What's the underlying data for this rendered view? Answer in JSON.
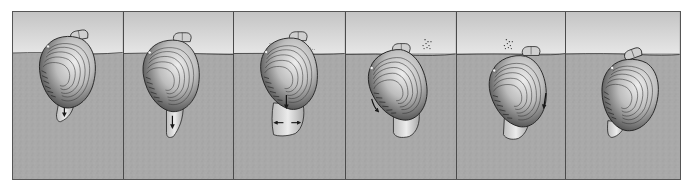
{
  "figure": {
    "panel_count": 6,
    "colors": {
      "water_top": "#c6c6c6",
      "water_bottom": "#e4e4e4",
      "sediment": "#a9a9a9",
      "sediment_speckle": "#9a9a9a",
      "outline": "#2a2a2a",
      "shell_light": "#e6e6e6",
      "shell_dark": "#4a4a4a",
      "foot": "#d8d8d8",
      "divider": "#4a4a4a"
    },
    "water_line_y": 41,
    "panels": [
      {
        "index": 1,
        "stage": "foot-probing",
        "arrows": [
          "down-in-foot"
        ],
        "particles": false,
        "width": 111
      },
      {
        "index": 2,
        "stage": "foot-extended",
        "arrows": [
          "down-in-foot"
        ],
        "particles": false,
        "width": 111
      },
      {
        "index": 3,
        "stage": "foot-anchoring",
        "arrows": [
          "down-at-shell",
          "left-in-foot",
          "right-in-foot"
        ],
        "particles": true,
        "width": 112
      },
      {
        "index": 4,
        "stage": "shell-rocking",
        "arrows": [
          "down-left-at-shell"
        ],
        "particles": true,
        "width": 111
      },
      {
        "index": 5,
        "stage": "shell-pulled-down",
        "arrows": [
          "down-right-at-shell"
        ],
        "particles": true,
        "width": 110
      },
      {
        "index": 6,
        "stage": "burrowed",
        "arrows": [],
        "particles": false,
        "width": 114
      }
    ]
  }
}
